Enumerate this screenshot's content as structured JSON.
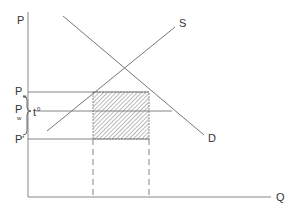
{
  "diagram": {
    "type": "supply-demand",
    "axes": {
      "y_label": "P",
      "x_label": "Q"
    },
    "curves": [
      {
        "name": "S",
        "label": "S"
      },
      {
        "name": "D",
        "label": "D"
      }
    ],
    "price_levels": [
      {
        "main": "P",
        "sub": "o"
      },
      {
        "main": "P",
        "sub": "w"
      },
      {
        "main": "P",
        "sub": "*"
      }
    ],
    "brace_label": {
      "main": "t",
      "sup": "0"
    },
    "shaded_region": "hatched rectangle",
    "colors": {
      "line": "#777777",
      "text": "#333333",
      "hatch": "#888888"
    }
  }
}
